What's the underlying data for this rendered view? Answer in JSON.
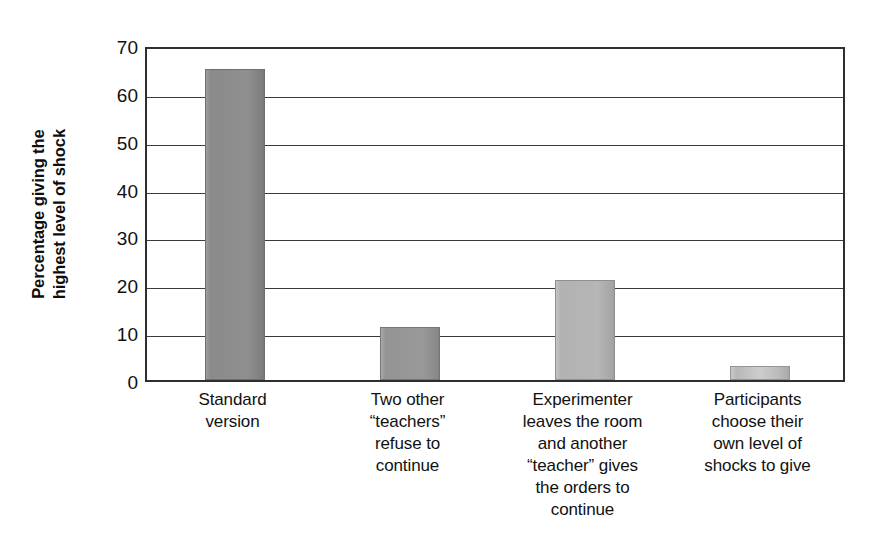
{
  "chart_data": {
    "type": "bar",
    "title": "",
    "xlabel": "",
    "ylabel": "Percentage giving the highest level of shock",
    "ylabel_lines": [
      "Percentage giving the",
      "highest level of shock"
    ],
    "categories": [
      "Standard version",
      "Two other “teachers” refuse to continue",
      "Experimenter leaves the room and another “teacher” gives the orders to continue",
      "Participants choose their own level of shocks to give"
    ],
    "category_lines": [
      [
        "Standard",
        "version"
      ],
      [
        "Two other",
        "“teachers”",
        "refuse to",
        "continue"
      ],
      [
        "Experimenter",
        "leaves the room",
        "and another",
        "“teacher” gives",
        "the orders to",
        "continue"
      ],
      [
        "Participants",
        "choose their",
        "own level of",
        "shocks to give"
      ]
    ],
    "values": [
      65,
      11,
      21,
      3
    ],
    "ylim": [
      0,
      70
    ],
    "yticks": [
      0,
      10,
      20,
      30,
      40,
      50,
      60,
      70
    ],
    "ytick_labels": [
      "0",
      "10",
      "20",
      "30",
      "40",
      "50",
      "60",
      "70"
    ],
    "grid": true,
    "grid_axis": "y",
    "legend": false,
    "bar_colors": [
      "#8d8d8d",
      "#979797",
      "#b4b4b4",
      "#bababa"
    ],
    "frame_color": "#2e2e2e",
    "gridline_color": "#3a3a3a",
    "background": "#ffffff"
  }
}
